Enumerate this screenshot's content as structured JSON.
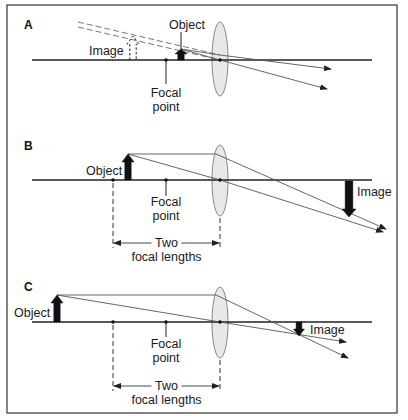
{
  "colors": {
    "border": "#333333",
    "axis": "#222222",
    "ray": "#555555",
    "lens_fill": "#e4e4e4",
    "lens_stroke": "#888888",
    "arrow": "#111111"
  },
  "panels": [
    {
      "id": "A",
      "label": "A",
      "label_pos": [
        24,
        29
      ],
      "axis_y": 60,
      "axis_x": [
        32,
        372
      ],
      "lens": {
        "cx": 220,
        "top": 22,
        "bottom": 96,
        "rx": 8
      },
      "focal_point": {
        "x": 166,
        "label_line1": "Focal",
        "label_line2": "point",
        "line_end_y": 84,
        "text_y1": 97,
        "text_y2": 111
      },
      "two_f_point": null,
      "object": {
        "label": "Object",
        "x": 181,
        "top": 49,
        "width": 10,
        "label_x": 187,
        "label_y": 29,
        "pointer": true
      },
      "image": {
        "label": "Image",
        "x": 133,
        "top": 36,
        "bottom": 60,
        "width": 10,
        "dashed": true,
        "label_x": 89,
        "label_y": 55
      },
      "rays": [
        {
          "points": [
            [
              181,
              49
            ],
            [
              220,
              55
            ],
            [
              331,
              69
            ]
          ],
          "arrow": true
        },
        {
          "points": [
            [
              181,
              49
            ],
            [
              220,
              60
            ],
            [
              327,
              89
            ]
          ],
          "arrow": true
        }
      ],
      "virtual_rays": [
        {
          "points": [
            [
              78,
              22
            ],
            [
              220,
              55
            ]
          ]
        },
        {
          "points": [
            [
              78,
              27
            ],
            [
              220,
              60
            ]
          ]
        }
      ],
      "dimension": null
    },
    {
      "id": "B",
      "label": "B",
      "label_pos": [
        24,
        150
      ],
      "axis_y": 180,
      "axis_x": [
        32,
        372
      ],
      "lens": {
        "cx": 220,
        "top": 145,
        "bottom": 216,
        "rx": 8
      },
      "focal_point": {
        "x": 166,
        "label_line1": "Focal",
        "label_line2": "point",
        "line_end_y": 196,
        "text_y1": 206,
        "text_y2": 220
      },
      "two_f_point": {
        "x": 113
      },
      "object": {
        "label": "Object",
        "x": 128,
        "top": 154,
        "width": 10,
        "label_x": 86,
        "label_y": 175,
        "pointer": false
      },
      "image": {
        "label": "Image",
        "x": 349,
        "top": 181,
        "bottom": 217,
        "width": 12,
        "dashed": false,
        "label_x": 357,
        "label_y": 196,
        "inverted": true
      },
      "rays": [
        {
          "points": [
            [
              128,
              154
            ],
            [
              216,
              154
            ],
            [
              386,
              229
            ]
          ],
          "arrow": true
        },
        {
          "points": [
            [
              128,
              154
            ],
            [
              220,
              180
            ],
            [
              383,
              232
            ]
          ],
          "arrow": true
        }
      ],
      "virtual_rays": [],
      "dimension": {
        "x1": 113,
        "x2": 220,
        "y": 243,
        "dash_top": 183,
        "line1": "Two",
        "line2": "focal lengths",
        "text_y1": 247,
        "text_y2": 261
      }
    },
    {
      "id": "C",
      "label": "C",
      "label_pos": [
        24,
        291
      ],
      "axis_y": 322,
      "axis_x": [
        32,
        372
      ],
      "lens": {
        "cx": 220,
        "top": 287,
        "bottom": 358,
        "rx": 8
      },
      "focal_point": {
        "x": 166,
        "label_line1": "Focal",
        "label_line2": "point",
        "line_end_y": 337,
        "text_y1": 348,
        "text_y2": 362
      },
      "two_f_point": {
        "x": 113
      },
      "object": {
        "label": "Object",
        "x": 57,
        "top": 295,
        "width": 10,
        "label_x": 14,
        "label_y": 317,
        "pointer": false
      },
      "image": {
        "label": "Image",
        "x": 299,
        "top": 322,
        "bottom": 336,
        "width": 9,
        "dashed": false,
        "label_x": 310,
        "label_y": 334,
        "inverted": true
      },
      "rays": [
        {
          "points": [
            [
              57,
              295
            ],
            [
              216,
              295
            ],
            [
              348,
              358
            ]
          ],
          "arrow": true
        },
        {
          "points": [
            [
              57,
              295
            ],
            [
              220,
              322
            ],
            [
              346,
              342
            ]
          ],
          "arrow": true
        }
      ],
      "virtual_rays": [],
      "dimension": {
        "x1": 113,
        "x2": 220,
        "y": 386,
        "dash_top": 325,
        "line1": "Two",
        "line2": "focal lengths",
        "text_y1": 390,
        "text_y2": 404
      }
    }
  ]
}
